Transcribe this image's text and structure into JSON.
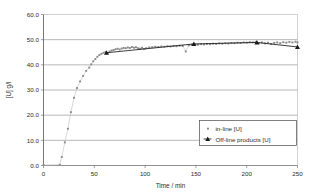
{
  "chart_data": {
    "type": "scatter",
    "title": "",
    "xlabel": "Time / min",
    "ylabel": "[U] g/l",
    "xlim": [
      0,
      250
    ],
    "ylim": [
      0,
      60
    ],
    "xticks": [
      "0",
      "50",
      "100",
      "150",
      "200",
      "250"
    ],
    "xtick_values": [
      0,
      50,
      100,
      150,
      200,
      250
    ],
    "yticks": [
      "0.0",
      "10.0",
      "20.0",
      "30.0",
      "40.0",
      "50.0",
      "60.0"
    ],
    "ytick_values": [
      0,
      10,
      20,
      30,
      40,
      50,
      60
    ],
    "grid": "horizontal",
    "legend_position": "lower-right-inside",
    "series": [
      {
        "name": "in-line [U]",
        "marker": "small-square-dot",
        "color": "#8a8a8a",
        "line": "thin-connecting",
        "points": [
          [
            0,
            0.2
          ],
          [
            16,
            0.3
          ],
          [
            18,
            3.4
          ],
          [
            21,
            9.2
          ],
          [
            24,
            14.6
          ],
          [
            27,
            21.2
          ],
          [
            30,
            26.9
          ],
          [
            33,
            30.8
          ],
          [
            36,
            33.4
          ],
          [
            39,
            35.6
          ],
          [
            42,
            37.6
          ],
          [
            45,
            38.9
          ],
          [
            47,
            40.2
          ],
          [
            49,
            41.4
          ],
          [
            51,
            42.3
          ],
          [
            53,
            43.2
          ],
          [
            55,
            43.9
          ],
          [
            57,
            44.4
          ],
          [
            59,
            44.8
          ],
          [
            61,
            45.1
          ],
          [
            63,
            44.6
          ],
          [
            65,
            45.3
          ],
          [
            67,
            45.7
          ],
          [
            69,
            45.9
          ],
          [
            71,
            46.2
          ],
          [
            73,
            46.4
          ],
          [
            75,
            46.1
          ],
          [
            77,
            46.5
          ],
          [
            79,
            46.7
          ],
          [
            81,
            46.6
          ],
          [
            83,
            46.9
          ],
          [
            85,
            46.7
          ],
          [
            87,
            47.1
          ],
          [
            89,
            46.8
          ],
          [
            91,
            47.0
          ],
          [
            93,
            46.6
          ],
          [
            95,
            46.4
          ],
          [
            97,
            46.8
          ],
          [
            99,
            46.3
          ],
          [
            101,
            46.6
          ],
          [
            104,
            46.9
          ],
          [
            107,
            47.0
          ],
          [
            110,
            47.2
          ],
          [
            113,
            47.1
          ],
          [
            116,
            47.3
          ],
          [
            119,
            47.2
          ],
          [
            122,
            47.4
          ],
          [
            125,
            47.3
          ],
          [
            128,
            47.5
          ],
          [
            131,
            47.4
          ],
          [
            134,
            47.6
          ],
          [
            137,
            47.5
          ],
          [
            140,
            45.3
          ],
          [
            143,
            47.8
          ],
          [
            146,
            48.0
          ],
          [
            149,
            48.1
          ],
          [
            152,
            48.0
          ],
          [
            155,
            48.2
          ],
          [
            158,
            48.1
          ],
          [
            161,
            48.3
          ],
          [
            164,
            48.2
          ],
          [
            167,
            48.4
          ],
          [
            170,
            48.3
          ],
          [
            173,
            48.5
          ],
          [
            176,
            48.4
          ],
          [
            179,
            48.6
          ],
          [
            182,
            48.5
          ],
          [
            185,
            48.7
          ],
          [
            188,
            48.6
          ],
          [
            191,
            48.8
          ],
          [
            194,
            48.7
          ],
          [
            197,
            48.9
          ],
          [
            200,
            48.8
          ],
          [
            203,
            49.0
          ],
          [
            206,
            48.9
          ],
          [
            209,
            49.1
          ],
          [
            212,
            48.6
          ],
          [
            215,
            48.9
          ],
          [
            218,
            48.5
          ],
          [
            221,
            48.8
          ],
          [
            224,
            48.3
          ],
          [
            227,
            48.7
          ],
          [
            230,
            48.9
          ],
          [
            233,
            48.6
          ],
          [
            236,
            49.0
          ],
          [
            239,
            48.8
          ],
          [
            242,
            49.1
          ],
          [
            245,
            48.9
          ],
          [
            248,
            49.2
          ],
          [
            250,
            48.9
          ]
        ]
      },
      {
        "name": "Off-line products [U]",
        "marker": "triangle",
        "color": "#1a1a1a",
        "line": "connecting",
        "points": [
          [
            62,
            44.8
          ],
          [
            148,
            48.3
          ],
          [
            210,
            48.9
          ],
          [
            250,
            47.1
          ]
        ]
      }
    ]
  },
  "legend": {
    "items": [
      {
        "label": "in-line [U]",
        "marker": "dot-marker"
      },
      {
        "label": "Off-line products [U]",
        "marker": "triangle-line-marker"
      }
    ]
  },
  "axes": {
    "x_title": "Time / min",
    "y_title": "[U] g/l"
  }
}
